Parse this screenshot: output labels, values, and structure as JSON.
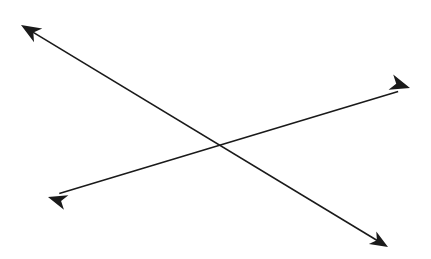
{
  "figure": {
    "background_color": "#ffffff",
    "width": 431,
    "height": 259,
    "stroke_color": "#1a1a1a",
    "shaft_width": 1.6,
    "intersection": {
      "x": 227,
      "y": 145
    }
  },
  "chart_data": {
    "type": "scatter",
    "xlabel": "",
    "ylabel": "",
    "xlim": [
      0,
      431
    ],
    "ylim": [
      0,
      259
    ],
    "grid": false,
    "legend": "none",
    "annotations": [
      {
        "name": "descending-arrow",
        "kind": "double-headed-arrow",
        "start": {
          "x": 21,
          "y": 25
        },
        "end": {
          "x": 388,
          "y": 247
        },
        "direction": "top-left to bottom-right",
        "color": "#1a1a1a"
      },
      {
        "name": "ascending-arrow",
        "kind": "double-headed-arrow",
        "start": {
          "x": 48,
          "y": 197
        },
        "end": {
          "x": 410,
          "y": 88
        },
        "direction": "bottom-left to top-right",
        "color": "#1a1a1a"
      }
    ],
    "intersection": {
      "x": 227,
      "y": 145
    }
  },
  "arrows": [
    {
      "id": "descending-arrow",
      "label": "Descending arrow",
      "color": "#1a1a1a",
      "tail": {
        "x": 21,
        "y": 25
      },
      "head": {
        "x": 388,
        "y": 247
      },
      "heads": [
        {
          "id": "arrowhead-top-left",
          "label": "Top-left arrowhead",
          "x": 21,
          "y": 25,
          "angle": 211,
          "size": 20
        },
        {
          "id": "arrowhead-bottom-right",
          "label": "Bottom-right arrowhead",
          "x": 388,
          "y": 247,
          "angle": 31,
          "size": 18
        }
      ]
    },
    {
      "id": "ascending-arrow",
      "label": "Ascending arrow",
      "color": "#1a1a1a",
      "tail": {
        "x": 48,
        "y": 197
      },
      "head": {
        "x": 410,
        "y": 88
      },
      "heads": [
        {
          "id": "arrowhead-bottom-left",
          "label": "Bottom-left arrowhead",
          "x": 48,
          "y": 197,
          "angle": 197,
          "size": 19
        },
        {
          "id": "arrowhead-top-right",
          "label": "Top-right arrowhead",
          "x": 410,
          "y": 88,
          "angle": 17,
          "size": 20
        }
      ]
    }
  ]
}
